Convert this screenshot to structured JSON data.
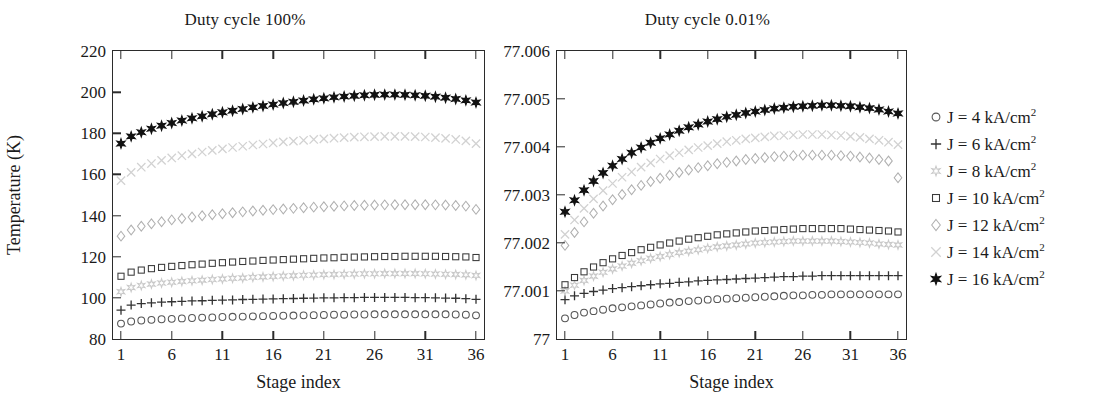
{
  "figure": {
    "ylabel": "Temperature (K)",
    "xlabel": "Stage index"
  },
  "panels": [
    {
      "key": "left",
      "title": "Duty cycle 100%",
      "xlabel": "Stage index",
      "xticks": [
        "1",
        "6",
        "11",
        "16",
        "21",
        "26",
        "31",
        "36"
      ],
      "yticks": [
        "80",
        "100",
        "120",
        "140",
        "160",
        "180",
        "200",
        "220"
      ]
    },
    {
      "key": "right",
      "title": "Duty cycle 0.01%",
      "xlabel": "Stage index",
      "xticks": [
        "1",
        "6",
        "11",
        "16",
        "21",
        "26",
        "31",
        "36"
      ],
      "yticks": [
        "77",
        "77.001",
        "77.002",
        "77.003",
        "77.004",
        "77.005",
        "77.006"
      ]
    }
  ],
  "legend": {
    "position": "right",
    "entries": [
      {
        "label": "J = 4 kA/cm",
        "exponent": "2",
        "marker": "circle",
        "color": "#555555"
      },
      {
        "label": "J = 6 kA/cm",
        "exponent": "2",
        "marker": "plus",
        "color": "#333333"
      },
      {
        "label": "J = 8 kA/cm",
        "exponent": "2",
        "marker": "star6",
        "color": "#c9c9c9"
      },
      {
        "label": "J = 10 kA/cm",
        "exponent": "2",
        "marker": "square",
        "color": "#3a3a3a"
      },
      {
        "label": "J = 12 kA/cm",
        "exponent": "2",
        "marker": "diamond",
        "color": "#b0b0b0"
      },
      {
        "label": "J = 14 kA/cm",
        "exponent": "2",
        "marker": "cross",
        "color": "#d2d2d2"
      },
      {
        "label": "J = 16 kA/cm",
        "exponent": "2",
        "marker": "star6f",
        "color": "#111111"
      }
    ]
  },
  "chart_data": [
    {
      "type": "scatter",
      "panel": "left",
      "title": "Duty cycle 100%",
      "xlabel": "Stage index",
      "ylabel": "Temperature (K)",
      "xlim": [
        1,
        36
      ],
      "ylim": [
        80,
        220
      ],
      "xticks": [
        1,
        6,
        11,
        16,
        21,
        26,
        31,
        36
      ],
      "yticks": [
        80,
        100,
        120,
        140,
        160,
        180,
        200,
        220
      ],
      "grid": false,
      "x": [
        1,
        2,
        3,
        4,
        5,
        6,
        7,
        8,
        9,
        10,
        11,
        12,
        13,
        14,
        15,
        16,
        17,
        18,
        19,
        20,
        21,
        22,
        23,
        24,
        25,
        26,
        27,
        28,
        29,
        30,
        31,
        32,
        33,
        34,
        35,
        36
      ],
      "series": [
        {
          "name": "J = 4 kA/cm2",
          "marker": "circle",
          "color": "#555555",
          "values": [
            87.5,
            88.5,
            89.0,
            89.3,
            89.6,
            89.8,
            90.0,
            90.2,
            90.4,
            90.5,
            90.7,
            90.8,
            90.9,
            91.0,
            91.1,
            91.2,
            91.3,
            91.4,
            91.5,
            91.6,
            91.7,
            91.8,
            91.8,
            91.9,
            91.9,
            92.0,
            92.0,
            92.0,
            92.0,
            92.0,
            92.0,
            92.0,
            92.0,
            91.9,
            91.8,
            91.5
          ]
        },
        {
          "name": "J = 6 kA/cm2",
          "marker": "plus",
          "color": "#333333",
          "values": [
            94.0,
            96.5,
            97.2,
            97.6,
            97.9,
            98.1,
            98.3,
            98.5,
            98.6,
            98.8,
            98.9,
            99.0,
            99.2,
            99.3,
            99.4,
            99.5,
            99.6,
            99.7,
            99.8,
            99.9,
            100.0,
            100.0,
            100.1,
            100.1,
            100.2,
            100.2,
            100.2,
            100.2,
            100.2,
            100.1,
            100.1,
            100.0,
            99.9,
            99.8,
            99.6,
            99.3
          ]
        },
        {
          "name": "J = 8 kA/cm2",
          "marker": "star6",
          "color": "#c9c9c9",
          "values": [
            103.0,
            105.0,
            106.0,
            106.7,
            107.2,
            107.6,
            108.0,
            108.3,
            108.6,
            108.9,
            109.2,
            109.5,
            109.7,
            110.0,
            110.2,
            110.4,
            110.6,
            110.8,
            111.0,
            111.1,
            111.3,
            111.4,
            111.5,
            111.6,
            111.7,
            111.7,
            111.8,
            111.8,
            111.8,
            111.8,
            111.7,
            111.6,
            111.5,
            111.4,
            111.2,
            110.9
          ]
        },
        {
          "name": "J = 10 kA/cm2",
          "marker": "square",
          "color": "#3a3a3a",
          "values": [
            110.5,
            112.5,
            113.5,
            114.2,
            114.8,
            115.3,
            115.7,
            116.1,
            116.4,
            116.8,
            117.1,
            117.4,
            117.7,
            117.9,
            118.2,
            118.4,
            118.6,
            118.8,
            119.0,
            119.2,
            119.4,
            119.5,
            119.7,
            119.8,
            119.9,
            120.0,
            120.1,
            120.1,
            120.2,
            120.2,
            120.2,
            120.2,
            120.1,
            120.0,
            119.9,
            119.6
          ]
        },
        {
          "name": "J = 12 kA/cm2",
          "marker": "diamond",
          "color": "#b0b0b0",
          "values": [
            130.0,
            133.0,
            134.8,
            136.0,
            137.0,
            137.9,
            138.6,
            139.3,
            139.9,
            140.4,
            140.9,
            141.4,
            141.8,
            142.2,
            142.6,
            142.9,
            143.2,
            143.5,
            143.8,
            144.1,
            144.3,
            144.5,
            144.7,
            144.9,
            145.0,
            145.1,
            145.2,
            145.3,
            145.3,
            145.3,
            145.3,
            145.2,
            145.1,
            144.9,
            144.6,
            143.0
          ]
        },
        {
          "name": "J = 14 kA/cm2",
          "marker": "cross",
          "color": "#d2d2d2",
          "values": [
            157.0,
            161.0,
            163.5,
            165.3,
            166.8,
            168.0,
            169.1,
            170.0,
            170.9,
            171.7,
            172.4,
            173.1,
            173.7,
            174.3,
            174.8,
            175.3,
            175.8,
            176.2,
            176.6,
            177.0,
            177.3,
            177.6,
            177.9,
            178.1,
            178.3,
            178.4,
            178.5,
            178.5,
            178.5,
            178.4,
            178.2,
            177.9,
            177.5,
            177.0,
            176.3,
            175.0
          ]
        },
        {
          "name": "J = 16 kA/cm2",
          "marker": "star6f",
          "color": "#111111",
          "values": [
            175.0,
            178.5,
            180.5,
            182.2,
            183.7,
            185.0,
            186.2,
            187.3,
            188.3,
            189.3,
            190.2,
            191.0,
            191.8,
            192.6,
            193.3,
            194.0,
            194.7,
            195.3,
            195.9,
            196.5,
            197.0,
            197.5,
            197.9,
            198.2,
            198.5,
            198.7,
            198.8,
            198.8,
            198.7,
            198.5,
            198.2,
            197.8,
            197.3,
            196.7,
            196.0,
            195.0
          ]
        }
      ]
    },
    {
      "type": "scatter",
      "panel": "right",
      "title": "Duty cycle 0.01%",
      "xlabel": "Stage index",
      "ylabel": "Temperature (K)",
      "xlim": [
        1,
        36
      ],
      "ylim": [
        77.0,
        77.006
      ],
      "xticks": [
        1,
        6,
        11,
        16,
        21,
        26,
        31,
        36
      ],
      "yticks": [
        77.0,
        77.001,
        77.002,
        77.003,
        77.004,
        77.005,
        77.006
      ],
      "grid": false,
      "x": [
        1,
        2,
        3,
        4,
        5,
        6,
        7,
        8,
        9,
        10,
        11,
        12,
        13,
        14,
        15,
        16,
        17,
        18,
        19,
        20,
        21,
        22,
        23,
        24,
        25,
        26,
        27,
        28,
        29,
        30,
        31,
        32,
        33,
        34,
        35,
        36
      ],
      "series": [
        {
          "name": "J = 4 kA/cm2",
          "marker": "circle",
          "color": "#555555",
          "values": [
            77.00043,
            77.0005,
            77.00055,
            77.00058,
            77.00061,
            77.00064,
            77.00066,
            77.00068,
            77.0007,
            77.00072,
            77.00074,
            77.00076,
            77.00077,
            77.00079,
            77.0008,
            77.00082,
            77.00083,
            77.00084,
            77.00085,
            77.00086,
            77.00087,
            77.00088,
            77.00089,
            77.0009,
            77.00091,
            77.00091,
            77.00092,
            77.00092,
            77.00093,
            77.00093,
            77.00093,
            77.00093,
            77.00093,
            77.00093,
            77.00093,
            77.00093
          ]
        },
        {
          "name": "J = 6 kA/cm2",
          "marker": "plus",
          "color": "#333333",
          "values": [
            77.00082,
            77.0009,
            77.00095,
            77.00099,
            77.00102,
            77.00105,
            77.00107,
            77.00109,
            77.00111,
            77.00113,
            77.00115,
            77.00116,
            77.00118,
            77.00119,
            77.00121,
            77.00122,
            77.00123,
            77.00124,
            77.00125,
            77.00126,
            77.00127,
            77.00128,
            77.00129,
            77.0013,
            77.0013,
            77.00131,
            77.00131,
            77.00132,
            77.00132,
            77.00132,
            77.00132,
            77.00132,
            77.00132,
            77.00132,
            77.00132,
            77.00132
          ]
        },
        {
          "name": "J = 8 kA/cm2",
          "marker": "star6",
          "color": "#c9c9c9",
          "values": [
            77.001,
            77.00112,
            77.00122,
            77.00131,
            77.00139,
            77.00146,
            77.00152,
            77.00158,
            77.00163,
            77.00168,
            77.00172,
            77.00176,
            77.0018,
            77.00183,
            77.00186,
            77.00189,
            77.00192,
            77.00194,
            77.00196,
            77.00198,
            77.002,
            77.00201,
            77.00202,
            77.00203,
            77.00204,
            77.00204,
            77.00204,
            77.00204,
            77.00204,
            77.00203,
            77.00202,
            77.00201,
            77.002,
            77.00198,
            77.00197,
            77.00196
          ]
        },
        {
          "name": "J = 10 kA/cm2",
          "marker": "square",
          "color": "#3a3a3a",
          "values": [
            77.00113,
            77.00128,
            77.0014,
            77.0015,
            77.00159,
            77.00167,
            77.00174,
            77.0018,
            77.00186,
            77.00191,
            77.00196,
            77.002,
            77.00204,
            77.00208,
            77.00211,
            77.00214,
            77.00217,
            77.00219,
            77.00221,
            77.00223,
            77.00225,
            77.00226,
            77.00227,
            77.00228,
            77.00229,
            77.0023,
            77.0023,
            77.0023,
            77.0023,
            77.0023,
            77.00229,
            77.00228,
            77.00227,
            77.00226,
            77.00225,
            77.00223
          ]
        },
        {
          "name": "J = 12 kA/cm2",
          "marker": "diamond",
          "color": "#b0b0b0",
          "values": [
            77.00195,
            77.00222,
            77.00244,
            77.00262,
            77.00277,
            77.0029,
            77.00301,
            77.00311,
            77.0032,
            77.00328,
            77.00335,
            77.00341,
            77.00347,
            77.00352,
            77.00357,
            77.00361,
            77.00365,
            77.00368,
            77.00371,
            77.00374,
            77.00376,
            77.00378,
            77.0038,
            77.00381,
            77.00382,
            77.00383,
            77.00383,
            77.00383,
            77.00383,
            77.00382,
            77.00381,
            77.00379,
            77.00377,
            77.00374,
            77.00371,
            77.00336
          ]
        },
        {
          "name": "J = 14 kA/cm2",
          "marker": "cross",
          "color": "#d2d2d2",
          "values": [
            77.00218,
            77.00248,
            77.00272,
            77.00292,
            77.00309,
            77.00324,
            77.00337,
            77.00348,
            77.00358,
            77.00367,
            77.00375,
            77.00382,
            77.00388,
            77.00394,
            77.00399,
            77.00403,
            77.00407,
            77.00411,
            77.00414,
            77.00417,
            77.00419,
            77.00421,
            77.00423,
            77.00424,
            77.00425,
            77.00426,
            77.00426,
            77.00426,
            77.00425,
            77.00424,
            77.00422,
            77.0042,
            77.00417,
            77.00414,
            77.0041,
            77.00405
          ]
        },
        {
          "name": "J = 16 kA/cm2",
          "marker": "star6f",
          "color": "#111111",
          "values": [
            77.00265,
            77.00289,
            77.0031,
            77.00329,
            77.00346,
            77.00361,
            77.00375,
            77.00388,
            77.00399,
            77.00409,
            77.00418,
            77.00426,
            77.00434,
            77.00441,
            77.00447,
            77.00453,
            77.00458,
            77.00463,
            77.00467,
            77.00471,
            77.00474,
            77.00477,
            77.0048,
            77.00482,
            77.00484,
            77.00485,
            77.00486,
            77.00487,
            77.00487,
            77.00486,
            77.00485,
            77.00483,
            77.00481,
            77.00478,
            77.00474,
            77.0047
          ]
        }
      ]
    }
  ]
}
